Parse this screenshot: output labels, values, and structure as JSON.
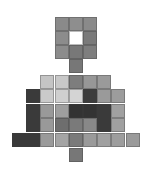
{
  "figure": {
    "cell_size": 14,
    "origin_x": 12,
    "col_step": 14.2,
    "rows": [
      {
        "y": 17,
        "cells": [
          {
            "c": 3,
            "color": "#8a8a8a"
          },
          {
            "c": 4,
            "color": "#8e8e8e"
          },
          {
            "c": 5,
            "color": "#8a8a8a"
          }
        ]
      },
      {
        "y": 31,
        "cells": [
          {
            "c": 3,
            "color": "#8c8c8c"
          },
          {
            "c": 4,
            "color": "#ffffff"
          },
          {
            "c": 5,
            "color": "#7a7a7a"
          }
        ]
      },
      {
        "y": 45,
        "cells": [
          {
            "c": 3,
            "color": "#8c8c8c"
          },
          {
            "c": 4,
            "color": "#787878"
          },
          {
            "c": 5,
            "color": "#7e7e7e"
          }
        ]
      },
      {
        "y": 59,
        "cells": [
          {
            "c": 4,
            "color": "#777777"
          }
        ]
      },
      {
        "y": 75,
        "cells": [
          {
            "c": 2,
            "color": "#c4c4c4"
          },
          {
            "c": 3,
            "color": "#c8c8c8"
          },
          {
            "c": 4,
            "color": "#7d7d7d"
          },
          {
            "c": 5,
            "color": "#979797"
          },
          {
            "c": 6,
            "color": "#9a9a9a"
          }
        ]
      },
      {
        "y": 89,
        "cells": [
          {
            "c": 1,
            "color": "#3a3a3a"
          },
          {
            "c": 2,
            "color": "#cacaca"
          },
          {
            "c": 3,
            "color": "#cfcfcf"
          },
          {
            "c": 4,
            "color": "#d4d4d4"
          },
          {
            "c": 5,
            "color": "#3c3c3c"
          },
          {
            "c": 6,
            "color": "#9a9a9a"
          },
          {
            "c": 7,
            "color": "#9c9c9c"
          }
        ]
      },
      {
        "y": 104,
        "cells": [
          {
            "c": 1,
            "color": "#3a3a3a"
          },
          {
            "c": 2,
            "color": "#999999"
          },
          {
            "c": 3,
            "color": "#9e9e9e"
          },
          {
            "c": 4,
            "color": "#333333"
          },
          {
            "c": 5,
            "color": "#333333"
          },
          {
            "c": 6,
            "color": "#3a3a3a"
          },
          {
            "c": 7,
            "color": "#a0a0a0"
          }
        ]
      },
      {
        "y": 118,
        "cells": [
          {
            "c": 1,
            "color": "#3a3a3a"
          },
          {
            "c": 2,
            "color": "#999999"
          },
          {
            "c": 3,
            "color": "#6e6e6e"
          },
          {
            "c": 4,
            "color": "#7a7a7a"
          },
          {
            "c": 5,
            "color": "#888888"
          },
          {
            "c": 6,
            "color": "#3a3a3a"
          },
          {
            "c": 7,
            "color": "#a0a0a0"
          }
        ]
      },
      {
        "y": 133,
        "cells": [
          {
            "c": 0,
            "color": "#3a3a3a"
          },
          {
            "c": 1,
            "color": "#3a3a3a"
          },
          {
            "c": 2,
            "color": "#9a9a9a"
          },
          {
            "c": 3,
            "color": "#a4a4a4"
          },
          {
            "c": 4,
            "color": "#7a7a7a"
          },
          {
            "c": 5,
            "color": "#9a9a9a"
          },
          {
            "c": 6,
            "color": "#a0a0a0"
          },
          {
            "c": 7,
            "color": "#9d9d9d"
          },
          {
            "c": 8,
            "color": "#9a9a9a"
          }
        ]
      },
      {
        "y": 148,
        "cells": [
          {
            "c": 4,
            "color": "#777777"
          }
        ]
      }
    ]
  }
}
